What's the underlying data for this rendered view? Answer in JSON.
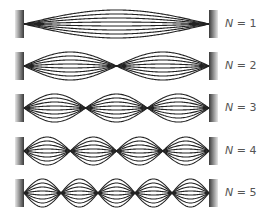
{
  "diagram": {
    "wall_left_x": [
      15,
      24
    ],
    "wall_right_x": [
      209,
      218
    ],
    "wall_half_height": 14,
    "string_amplitudes": [
      14,
      10,
      6,
      2
    ],
    "line_color": "#222222",
    "wall_gradient_light": "#e6e6e6",
    "wall_gradient_dark": "#3a3a3a",
    "label_color": "#555555",
    "modes": [
      {
        "n": 1,
        "center_y": 24,
        "label_var": "N",
        "label_rest": " = 1"
      },
      {
        "n": 2,
        "center_y": 66,
        "label_var": "N",
        "label_rest": " = 2"
      },
      {
        "n": 3,
        "center_y": 108,
        "label_var": "N",
        "label_rest": " = 3"
      },
      {
        "n": 4,
        "center_y": 151,
        "label_var": "N",
        "label_rest": " = 4"
      },
      {
        "n": 5,
        "center_y": 193,
        "label_var": "N",
        "label_rest": " = 5"
      }
    ]
  }
}
